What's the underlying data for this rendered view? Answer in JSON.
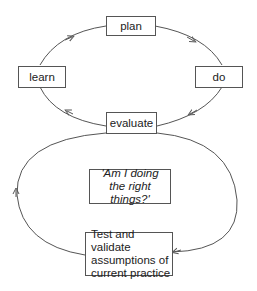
{
  "diagram": {
    "type": "cycle-diagram",
    "inner_cycle": {
      "nodes": [
        {
          "id": "plan",
          "label": "plan"
        },
        {
          "id": "do",
          "label": "do"
        },
        {
          "id": "evaluate",
          "label": "evaluate"
        },
        {
          "id": "learn",
          "label": "learn"
        }
      ],
      "edges": [
        {
          "from": "plan",
          "to": "do"
        },
        {
          "from": "do",
          "to": "evaluate"
        },
        {
          "from": "evaluate",
          "to": "learn"
        },
        {
          "from": "learn",
          "to": "plan"
        }
      ]
    },
    "outer_loop": {
      "center_label": {
        "line1": "'Am I doing",
        "line2": "the right things?'"
      },
      "nodes": [
        {
          "id": "test",
          "lines": [
            "Test and validate",
            "assumptions of",
            "current practice"
          ]
        }
      ],
      "edges": [
        {
          "from": "evaluate",
          "to": "test",
          "side": "right"
        },
        {
          "from": "test",
          "to": "evaluate",
          "side": "left"
        }
      ]
    },
    "colors": {
      "line": "#555555",
      "text": "#222222",
      "background": "#ffffff"
    }
  }
}
